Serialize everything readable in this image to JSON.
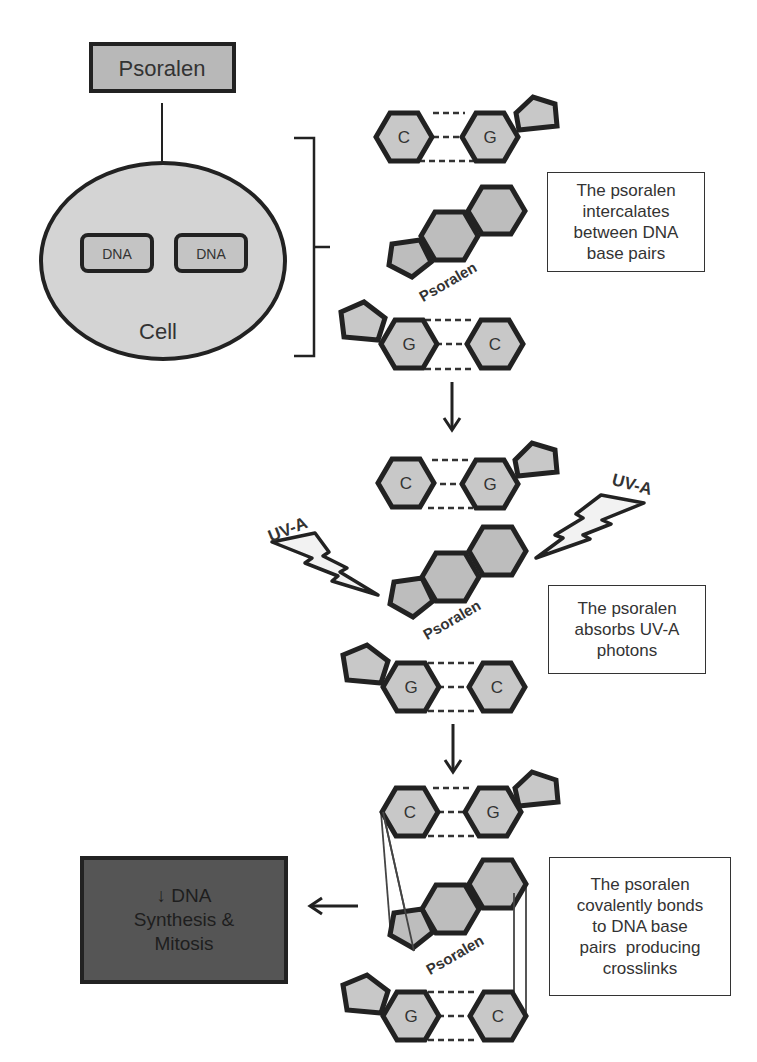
{
  "diagram": {
    "colors": {
      "stroke": "#222222",
      "base_fill": "#c8c8c8",
      "psoralen_fill": "#bdbdbd",
      "cell_fill": "#d4d4d4",
      "dna_box_fill": "#c4c4c4",
      "psoralen_box_fill": "#b8b8b8",
      "outcome_fill": "#555555",
      "text": "#333333",
      "bolt_fill": "#f2f2f2"
    },
    "psoralen_box": {
      "label": "Psoralen"
    },
    "cell": {
      "label": "Cell",
      "dna_boxes": [
        {
          "label": "DNA"
        },
        {
          "label": "DNA"
        }
      ]
    },
    "stages": [
      {
        "name": "intercalation",
        "top_pair": {
          "left": "C",
          "right": "G"
        },
        "molecule_label": "Psoralen",
        "bottom_pair": {
          "left": "G",
          "right": "C"
        },
        "note_lines": [
          "The psoralen",
          "intercalates",
          "between DNA",
          "base pairs"
        ]
      },
      {
        "name": "uv-absorption",
        "top_pair": {
          "left": "C",
          "right": "G"
        },
        "molecule_label": "Psoralen",
        "bottom_pair": {
          "left": "G",
          "right": "C"
        },
        "uv_labels": [
          "UV-A",
          "UV-A"
        ],
        "note_lines": [
          "The psoralen",
          "absorbs UV-A",
          "photons"
        ]
      },
      {
        "name": "crosslinking",
        "top_pair": {
          "left": "C",
          "right": "G"
        },
        "molecule_label": "Psoralen",
        "bottom_pair": {
          "left": "G",
          "right": "C"
        },
        "note_lines": [
          "The psoralen",
          "covalently bonds",
          "to DNA base",
          "pairs  producing",
          "crosslinks"
        ]
      }
    ],
    "outcome": {
      "lines": [
        "↓ DNA",
        "Synthesis &",
        "Mitosis"
      ]
    }
  }
}
